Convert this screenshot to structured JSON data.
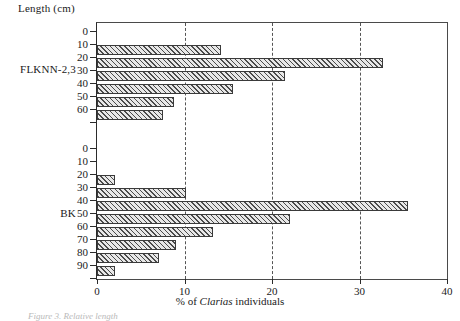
{
  "figure": {
    "y_axis_title": "Length (cm)",
    "x_axis_title_prefix": "% of ",
    "x_axis_title_italic": "Clarias",
    "x_axis_title_suffix": " individuals",
    "caption": "Figure 3. Relative length"
  },
  "chart_data": {
    "type": "bar",
    "orientation": "horizontal",
    "title": "",
    "xlabel": "% of Clarias individuals",
    "ylabel": "Length (cm)",
    "xlim": [
      0,
      40
    ],
    "xticks": [
      0,
      10,
      20,
      30,
      40
    ],
    "xticklabels": [
      "0",
      "10",
      "20",
      "30",
      "40"
    ],
    "grid": "vertical-dashed-at-10-20-30",
    "legend": "none",
    "panels": [
      {
        "name": "FLKNN-2,3",
        "categories": [
          0,
          10,
          20,
          30,
          40,
          50,
          60
        ],
        "ticklabels": [
          "0",
          "10",
          "20",
          "30",
          "40",
          "50",
          "60"
        ],
        "values": [
          0,
          14.2,
          32.7,
          21.5,
          15.5,
          8.8,
          7.5
        ]
      },
      {
        "name": "BK",
        "categories": [
          0,
          10,
          20,
          30,
          40,
          50,
          60,
          70,
          80,
          90
        ],
        "ticklabels": [
          "0",
          "10",
          "20",
          "30",
          "40",
          "50",
          "60",
          "70",
          "80",
          "90"
        ],
        "values": [
          0,
          0,
          2.1,
          10.2,
          35.5,
          22.0,
          13.2,
          9.0,
          7.1,
          2.1
        ]
      }
    ]
  }
}
